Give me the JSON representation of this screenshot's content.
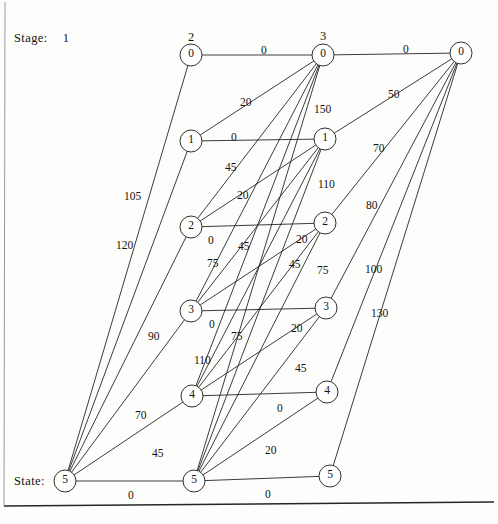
{
  "diagram": {
    "type": "stage-state-network",
    "stage_label": "Stage:",
    "state_label": "State:",
    "column_headers": [
      {
        "text": "1",
        "x": 60,
        "y": 38
      },
      {
        "text": "2",
        "x": 191,
        "y": 30
      },
      {
        "text": "3",
        "x": 323,
        "y": 29
      }
    ],
    "nodes": [
      {
        "id": "c2r0",
        "label": "0",
        "x": 191,
        "y": 55,
        "r": 11
      },
      {
        "id": "c2r1",
        "label": "1",
        "x": 191,
        "y": 141,
        "r": 11
      },
      {
        "id": "c2r2",
        "label": "2",
        "x": 191,
        "y": 227,
        "r": 11
      },
      {
        "id": "c2r3",
        "label": "3",
        "x": 191,
        "y": 311,
        "r": 11
      },
      {
        "id": "c2r4",
        "label": "4",
        "x": 192,
        "y": 396,
        "r": 11
      },
      {
        "id": "c1r5",
        "label": "5",
        "x": 65,
        "y": 481,
        "r": 11
      },
      {
        "id": "c3r0",
        "label": "0",
        "x": 323,
        "y": 55,
        "r": 11
      },
      {
        "id": "c3r1",
        "label": "1",
        "x": 325,
        "y": 139,
        "r": 11
      },
      {
        "id": "c3r2",
        "label": "2",
        "x": 325,
        "y": 223,
        "r": 11
      },
      {
        "id": "c3r3",
        "label": "3",
        "x": 326,
        "y": 308,
        "r": 11
      },
      {
        "id": "c3r4",
        "label": "4",
        "x": 327,
        "y": 392,
        "r": 11
      },
      {
        "id": "c2r5",
        "label": "5",
        "x": 194,
        "y": 481,
        "r": 11
      },
      {
        "id": "c4r0",
        "label": "0",
        "x": 461,
        "y": 53,
        "r": 11
      },
      {
        "id": "c3r5",
        "label": "5",
        "x": 330,
        "y": 476,
        "r": 11
      }
    ],
    "edges": [
      {
        "from": "c2r0",
        "to": "c3r0",
        "weight": "0"
      },
      {
        "from": "c3r0",
        "to": "c4r0",
        "weight": "0"
      },
      {
        "from": "c2r1",
        "to": "c3r1",
        "weight": "0"
      },
      {
        "from": "c2r2",
        "to": "c3r2",
        "weight": "0"
      },
      {
        "from": "c2r3",
        "to": "c3r3",
        "weight": "0"
      },
      {
        "from": "c2r4",
        "to": "c3r4",
        "weight": "0"
      },
      {
        "from": "c1r5",
        "to": "c2r5",
        "weight": "0"
      },
      {
        "from": "c2r5",
        "to": "c3r5",
        "weight": "0"
      },
      {
        "from": "c2r1",
        "to": "c3r0",
        "weight": "20"
      },
      {
        "from": "c2r2",
        "to": "c3r0",
        "weight": ""
      },
      {
        "from": "c2r3",
        "to": "c3r0",
        "weight": ""
      },
      {
        "from": "c2r4",
        "to": "c3r0",
        "weight": ""
      },
      {
        "from": "c2r5",
        "to": "c3r0",
        "weight": "150"
      },
      {
        "from": "c2r2",
        "to": "c3r1",
        "weight": "45"
      },
      {
        "from": "c2r3",
        "to": "c3r1",
        "weight": ""
      },
      {
        "from": "c2r4",
        "to": "c3r1",
        "weight": ""
      },
      {
        "from": "c2r5",
        "to": "c3r1",
        "weight": "110"
      },
      {
        "from": "c2r3",
        "to": "c3r2",
        "weight": "20"
      },
      {
        "from": "c2r4",
        "to": "c3r2",
        "weight": ""
      },
      {
        "from": "c2r5",
        "to": "c3r2",
        "weight": "75"
      },
      {
        "from": "c2r4",
        "to": "c3r3",
        "weight": "20"
      },
      {
        "from": "c2r5",
        "to": "c3r3",
        "weight": "45"
      },
      {
        "from": "c2r5",
        "to": "c3r4",
        "weight": "20"
      },
      {
        "from": "c1r5",
        "to": "c2r0",
        "weight": "120"
      },
      {
        "from": "c1r5",
        "to": "c2r1",
        "weight": "105"
      },
      {
        "from": "c1r5",
        "to": "c2r2",
        "weight": "90"
      },
      {
        "from": "c1r5",
        "to": "c2r3",
        "weight": "70"
      },
      {
        "from": "c1r5",
        "to": "c2r4",
        "weight": "45"
      },
      {
        "from": "c3r1",
        "to": "c4r0",
        "weight": "50"
      },
      {
        "from": "c3r2",
        "to": "c4r0",
        "weight": "70"
      },
      {
        "from": "c3r3",
        "to": "c4r0",
        "weight": "80"
      },
      {
        "from": "c3r4",
        "to": "c4r0",
        "weight": "100"
      },
      {
        "from": "c3r5",
        "to": "c4r0",
        "weight": "130"
      }
    ],
    "edge_labels": [
      {
        "text": "0",
        "x": 261,
        "y": 44
      },
      {
        "text": "0",
        "x": 403,
        "y": 43
      },
      {
        "text": "20",
        "x": 240,
        "y": 96
      },
      {
        "text": "150",
        "x": 314,
        "y": 103
      },
      {
        "text": "50",
        "x": 388,
        "y": 88
      },
      {
        "text": "0",
        "x": 231,
        "y": 131
      },
      {
        "text": "45",
        "x": 225,
        "y": 161
      },
      {
        "text": "110",
        "x": 318,
        "y": 178
      },
      {
        "text": "70",
        "x": 373,
        "y": 142
      },
      {
        "text": "105",
        "x": 124,
        "y": 190
      },
      {
        "text": "20",
        "x": 237,
        "y": 189
      },
      {
        "text": "0",
        "x": 208,
        "y": 234
      },
      {
        "text": "45",
        "x": 238,
        "y": 240
      },
      {
        "text": "20",
        "x": 296,
        "y": 233
      },
      {
        "text": "80",
        "x": 366,
        "y": 199
      },
      {
        "text": "120",
        "x": 116,
        "y": 239
      },
      {
        "text": "75",
        "x": 207,
        "y": 257
      },
      {
        "text": "45",
        "x": 289,
        "y": 258
      },
      {
        "text": "75",
        "x": 317,
        "y": 264
      },
      {
        "text": "100",
        "x": 365,
        "y": 263
      },
      {
        "text": "0",
        "x": 209,
        "y": 318
      },
      {
        "text": "75",
        "x": 231,
        "y": 330
      },
      {
        "text": "20",
        "x": 291,
        "y": 322
      },
      {
        "text": "130",
        "x": 371,
        "y": 307
      },
      {
        "text": "90",
        "x": 148,
        "y": 330
      },
      {
        "text": "110",
        "x": 194,
        "y": 354
      },
      {
        "text": "45",
        "x": 295,
        "y": 362
      },
      {
        "text": "0",
        "x": 277,
        "y": 402
      },
      {
        "text": "70",
        "x": 135,
        "y": 409
      },
      {
        "text": "45",
        "x": 152,
        "y": 447
      },
      {
        "text": "20",
        "x": 265,
        "y": 444
      },
      {
        "text": "0",
        "x": 128,
        "y": 489
      },
      {
        "text": "0",
        "x": 265,
        "y": 488
      }
    ],
    "frame": {
      "bottom_rule_y": 505,
      "left_rule_x": 4
    }
  },
  "colors": {
    "line": "#1a1a1a",
    "node_stroke": "#1a1a1a",
    "node_fill": "#ffffff",
    "text": "#15130f",
    "background": "#fdfdfc"
  }
}
